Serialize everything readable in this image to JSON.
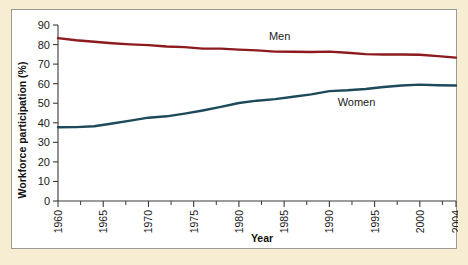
{
  "chart_data": {
    "type": "line",
    "title": "",
    "xlabel": "Year",
    "ylabel": "Workforce participation (%)",
    "xlim": [
      1960,
      2004
    ],
    "ylim": [
      0,
      90
    ],
    "yticks": [
      0,
      10,
      20,
      30,
      40,
      50,
      60,
      70,
      80,
      90
    ],
    "xticks": [
      1960,
      1965,
      1970,
      1975,
      1980,
      1985,
      1990,
      1995,
      2000,
      2004
    ],
    "xtick_labels": [
      "1960",
      "1965",
      "1970",
      "1975",
      "1980",
      "1985",
      "1990",
      "1995",
      "2000",
      "2004"
    ],
    "xtick_rotation": 90,
    "xminor_step": 2.5,
    "grid": false,
    "legend_position": "inline-annotations",
    "x": [
      1960,
      1962,
      1964,
      1966,
      1968,
      1970,
      1972,
      1974,
      1976,
      1978,
      1980,
      1982,
      1984,
      1986,
      1988,
      1990,
      1992,
      1994,
      1996,
      1998,
      2000,
      2002,
      2004
    ],
    "series": [
      {
        "name": "Men",
        "color": "#8c1a1f",
        "values": [
          83.3,
          82.2,
          81.4,
          80.7,
          80.1,
          79.7,
          79.0,
          78.7,
          77.9,
          77.9,
          77.4,
          77.0,
          76.4,
          76.3,
          76.2,
          76.4,
          75.8,
          75.1,
          74.9,
          74.9,
          74.8,
          74.1,
          73.3
        ]
      },
      {
        "name": "Women",
        "color": "#1d4a5a",
        "values": [
          37.7,
          37.8,
          38.2,
          39.6,
          41.1,
          42.6,
          43.3,
          44.7,
          46.3,
          48.1,
          50.1,
          51.3,
          52.1,
          53.3,
          54.5,
          56.2,
          56.6,
          57.3,
          58.3,
          59.1,
          59.5,
          59.2,
          59.1
        ]
      }
    ],
    "annotations": [
      {
        "text": "Men",
        "x": 1984.5,
        "y": 82.5
      },
      {
        "text": "Women",
        "x": 1993.0,
        "y": 48.5
      }
    ]
  },
  "colors": {
    "page_background": "#f7edd2",
    "card_background": "#ffffff",
    "card_border": "#9a9a90",
    "axis": "#3a3a3a",
    "men": "#8c1a1f",
    "women": "#1d4a5a"
  }
}
